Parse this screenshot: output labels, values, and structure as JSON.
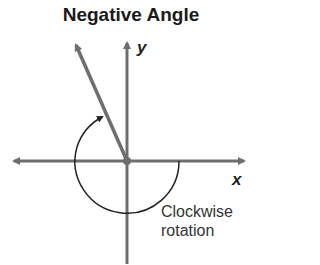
{
  "title": "Negative Angle",
  "axes": {
    "x_label": "x",
    "y_label": "y"
  },
  "annotation": {
    "line1": "Clockwise",
    "line2": "rotation"
  },
  "colors": {
    "axis": "#6e6e6e",
    "ray": "#6e6e6e",
    "arc": "#222222",
    "text": "#1a1a1a"
  }
}
